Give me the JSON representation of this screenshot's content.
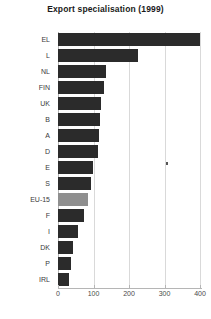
{
  "chart_data": {
    "type": "bar",
    "orientation": "horizontal",
    "title": "Export specialisation (1999)",
    "xlabel": "",
    "ylabel": "",
    "categories": [
      "EL",
      "L",
      "NL",
      "FIN",
      "UK",
      "B",
      "A",
      "D",
      "E",
      "S",
      "EU-15",
      "F",
      "I",
      "DK",
      "P",
      "IRL"
    ],
    "values": [
      400,
      225,
      135,
      130,
      120,
      118,
      115,
      112,
      98,
      92,
      85,
      72,
      55,
      42,
      38,
      32
    ],
    "highlight_category": "EU-15",
    "xlim": [
      0,
      400
    ],
    "xticks": [
      0,
      100,
      200,
      300,
      400
    ],
    "xtick_labels": [
      "0",
      "100",
      "200",
      "300",
      "400"
    ],
    "grid": true,
    "legend": false,
    "bar_color": "#2b2b2b",
    "highlight_color": "#8f8f8f",
    "grid_color": "#d9d9d9",
    "axis_color": "#b5b5b5",
    "title_color": "#1a1a1a"
  }
}
